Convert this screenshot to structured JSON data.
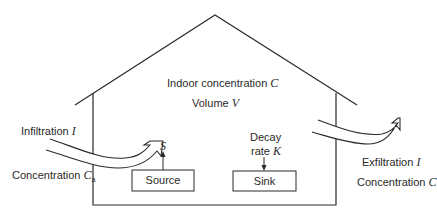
{
  "house": {
    "indoor_label": "Indoor concentration",
    "indoor_symbol": "C",
    "volume_label": "Volume",
    "volume_symbol": "V"
  },
  "inflow": {
    "label": "Infiltration",
    "symbol": "I",
    "conc_label": "Concentration",
    "conc_symbol": "C",
    "conc_subscript": "a"
  },
  "outflow": {
    "label": "Exfiltration",
    "symbol": "I",
    "conc_label": "Concentration",
    "conc_symbol": "C"
  },
  "source": {
    "box_label": "Source",
    "rate_symbol": "S"
  },
  "sink": {
    "box_label": "Sink",
    "rate_label_line1": "Decay",
    "rate_label_line2": "rate",
    "rate_symbol": "K"
  },
  "colors": {
    "line": "#2a2a2a",
    "background": "#ffffff"
  }
}
